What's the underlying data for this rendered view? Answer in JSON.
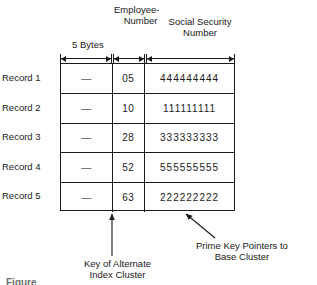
{
  "figure": {
    "headers": {
      "employee_number_line1": "Employee-",
      "employee_number_line2": "Number",
      "social_security_line1": "Social Security",
      "social_security_line2": "Number",
      "bytes_label": "5 Bytes"
    },
    "columns": [
      "Filler",
      "Employee-Number",
      "Social Security Number"
    ],
    "rows": [
      {
        "label": "Record 1",
        "filler": "—",
        "employee_number": "05",
        "ssn": "444444444"
      },
      {
        "label": "Record 2",
        "filler": "—",
        "employee_number": "10",
        "ssn": "111111111"
      },
      {
        "label": "Record 3",
        "filler": "—",
        "employee_number": "28",
        "ssn": "333333333"
      },
      {
        "label": "Record 4",
        "filler": "—",
        "employee_number": "52",
        "ssn": "555555555"
      },
      {
        "label": "Record 5",
        "filler": "—",
        "employee_number": "63",
        "ssn": "222222222"
      }
    ],
    "callouts": {
      "key_line1": "Key of Alternate",
      "key_line2": "Index Cluster",
      "prime_line1": "Prime Key Pointers to",
      "prime_line2": "Base Cluster"
    },
    "caption": "Figure",
    "colors": {
      "ink": "#1a1a1a",
      "paper": "#ffffff",
      "caption": "#6e6e6e"
    }
  }
}
